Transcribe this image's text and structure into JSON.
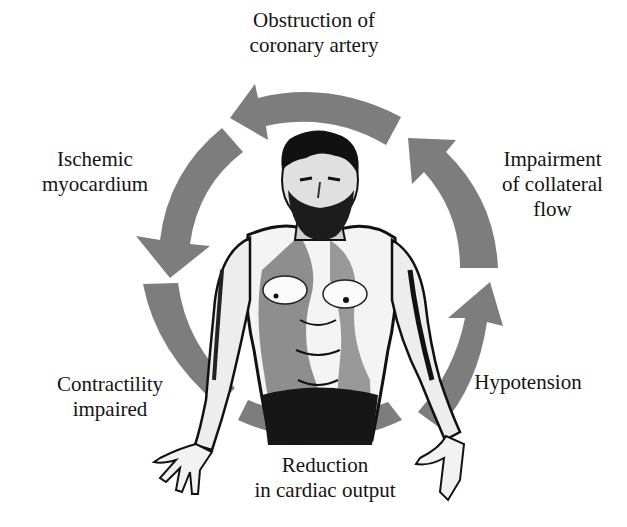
{
  "diagram": {
    "type": "cycle",
    "direction": "counterclockwise",
    "center_figure": "engraved-bearded-male-torso",
    "arrow_color": "#7d7d7d",
    "text_color": "#141414",
    "nodes": [
      {
        "id": "obstruction",
        "lines": [
          "Obstruction of",
          "coronary artery"
        ]
      },
      {
        "id": "ischemic",
        "lines": [
          "Ischemic",
          "myocardium"
        ]
      },
      {
        "id": "contractility",
        "lines": [
          "Contractility",
          "impaired"
        ]
      },
      {
        "id": "reduction",
        "lines": [
          "Reduction",
          "in cardiac output"
        ]
      },
      {
        "id": "hypotension",
        "lines": [
          "Hypotension"
        ]
      },
      {
        "id": "impairment",
        "lines": [
          "Impairment",
          "of collateral",
          "flow"
        ]
      }
    ],
    "edges": [
      {
        "from": "obstruction",
        "to": "ischemic"
      },
      {
        "from": "ischemic",
        "to": "contractility"
      },
      {
        "from": "contractility",
        "to": "reduction"
      },
      {
        "from": "reduction",
        "to": "hypotension"
      },
      {
        "from": "hypotension",
        "to": "impairment"
      },
      {
        "from": "impairment",
        "to": "obstruction"
      }
    ]
  }
}
